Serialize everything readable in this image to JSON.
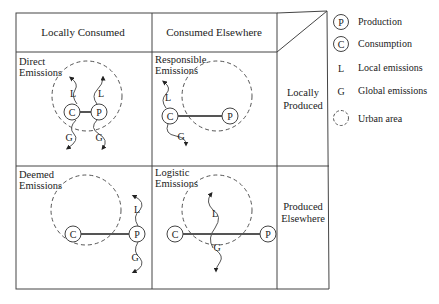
{
  "columns": {
    "local_consumed": "Locally Consumed",
    "consumed_elsewhere": "Consumed Elsewhere"
  },
  "rows": {
    "locally_produced": [
      "Locally",
      "Produced"
    ],
    "produced_elsewhere": [
      "Produced",
      "Elsewhere"
    ]
  },
  "cells": {
    "direct": [
      "Direct",
      "Emissions"
    ],
    "responsible": [
      "Responsible",
      "Emissions"
    ],
    "deemed": [
      "Deemed",
      "Emissions"
    ],
    "logistic": [
      "Logistic",
      "Emissions"
    ]
  },
  "nodes": {
    "production": "P",
    "consumption": "C",
    "local": "L",
    "global": "G"
  },
  "legend": [
    {
      "symbol": "P",
      "label": "Production"
    },
    {
      "symbol": "C",
      "label": "Consumption"
    },
    {
      "symbol": "L",
      "label": "Local emissions"
    },
    {
      "symbol": "G",
      "label": "Global emissions"
    },
    {
      "symbol": "dashed-circle",
      "label": "Urban area"
    }
  ]
}
